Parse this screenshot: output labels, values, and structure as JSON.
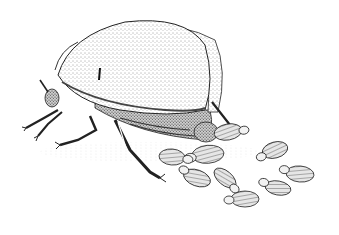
{
  "illustration": {
    "subject": "stippled drawing of an adult beetle with a cluster of larvae",
    "style": "black ink stipple on white",
    "colors": {
      "background": "#ffffff",
      "ink": "#1a1a1a",
      "shade": "#8a8a8a",
      "light_shade": "#d8d8d8"
    },
    "larvae_count": 9
  }
}
